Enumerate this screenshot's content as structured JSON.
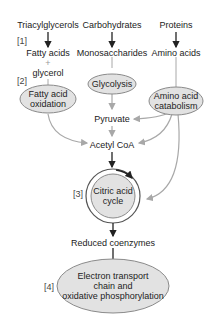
{
  "diagram": {
    "colors": {
      "ellipse_fill": "#e2e2e2",
      "ellipse_stroke": "#8a8a8a",
      "arrow_dark": "#222222",
      "arrow_gray": "#a8a8a8",
      "text": "#222222"
    },
    "sources": {
      "triacylglycerols": "Triacylglycerols",
      "carbohydrates": "Carbohydrates",
      "proteins": "Proteins"
    },
    "intermediates": {
      "fatty_acids": "Fatty acids",
      "plus": "+",
      "glycerol": "glycerol",
      "monosaccharides": "Monosaccharides",
      "amino_acids": "Amino acids",
      "pyruvate": "Pyruvate",
      "acetyl_coa": "Acetyl CoA",
      "reduced_coenzymes": "Reduced coenzymes"
    },
    "processes": {
      "fatty_acid_oxidation_1": "Fatty acid",
      "fatty_acid_oxidation_2": "oxidation",
      "glycolysis": "Glycolysis",
      "amino_acid_catabolism_1": "Amino acid",
      "amino_acid_catabolism_2": "catabolism",
      "citric_acid_cycle_1": "Citric acid",
      "citric_acid_cycle_2": "cycle",
      "etc_1": "Electron transport",
      "etc_2": "chain and",
      "etc_3": "oxidative phosphorylation"
    },
    "steps": {
      "s1": "[1]",
      "s2": "[2]",
      "s3": "[3]",
      "s4": "[4]"
    }
  }
}
